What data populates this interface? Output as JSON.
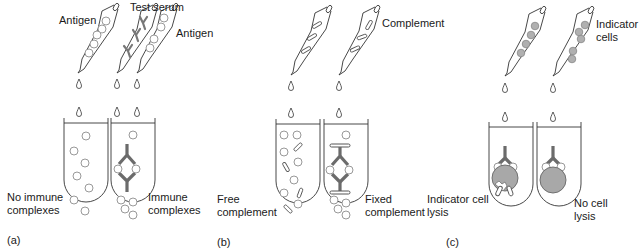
{
  "figure": {
    "panels": [
      {
        "id": "a",
        "tag": "(a)",
        "bottle_labels": {
          "antigen_left": "Antigen",
          "test_serum": "Test serum",
          "antigen_right": "Antigen"
        },
        "tube_labels": {
          "left": [
            "No immune",
            "complexes"
          ],
          "right": [
            "Immune",
            "complexes"
          ]
        }
      },
      {
        "id": "b",
        "tag": "(b)",
        "bottle_labels": {
          "complement": "Complement"
        },
        "tube_labels": {
          "left": [
            "Free",
            "complement"
          ],
          "right": [
            "Fixed",
            "complement"
          ]
        }
      },
      {
        "id": "c",
        "tag": "(c)",
        "bottle_labels": {
          "indicator": [
            "Indicator",
            "cells"
          ]
        },
        "tube_labels": {
          "left": [
            "Indicator cell",
            "lysis"
          ],
          "right": [
            "No cell",
            "lysis"
          ]
        }
      }
    ],
    "colors": {
      "line": "#333333",
      "antibody": "#6b6b6b",
      "antigen_circle": "#999999",
      "indicator_cell": "#a8a8a8"
    }
  }
}
